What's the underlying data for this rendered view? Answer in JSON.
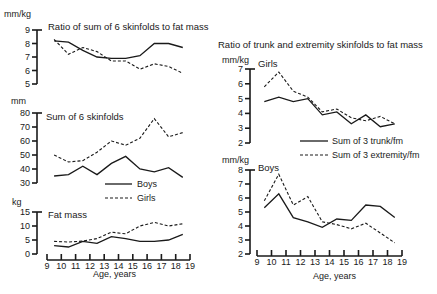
{
  "chart_data": [
    {
      "type": "line",
      "title": "Ratio of sum of 6 skinfolds to fat mass",
      "ylabel": "mm/kg",
      "xlabel": "Age, years",
      "ylim": [
        5,
        9
      ],
      "yticks": [
        5,
        6,
        7,
        8,
        9
      ],
      "x": [
        9.5,
        10.5,
        11.5,
        12.5,
        13.5,
        14.5,
        15.5,
        16.5,
        17.5,
        18.5
      ],
      "series": [
        {
          "name": "Boys",
          "style": "solid",
          "values": [
            8.2,
            8.1,
            7.5,
            7.0,
            6.9,
            6.9,
            7.1,
            8.0,
            8.0,
            7.7
          ]
        },
        {
          "name": "Girls",
          "style": "dashed",
          "values": [
            8.3,
            7.2,
            7.7,
            7.4,
            6.7,
            6.7,
            6.1,
            6.5,
            6.3,
            5.8
          ]
        }
      ]
    },
    {
      "type": "line",
      "title": "Sum of 6 skinfolds",
      "ylabel": "mm",
      "xlabel": "Age, years",
      "ylim": [
        30,
        80
      ],
      "yticks": [
        30,
        40,
        50,
        60,
        70,
        80
      ],
      "x": [
        9.5,
        10.5,
        11.5,
        12.5,
        13.5,
        14.5,
        15.5,
        16.5,
        17.5,
        18.5
      ],
      "series": [
        {
          "name": "Boys",
          "style": "solid",
          "values": [
            35,
            36,
            42,
            36,
            44,
            49,
            40,
            38,
            41,
            34
          ]
        },
        {
          "name": "Girls",
          "style": "dashed",
          "values": [
            50,
            45,
            46,
            52,
            60,
            57,
            62,
            76,
            63,
            66
          ]
        }
      ]
    },
    {
      "type": "line",
      "title": "Fat mass",
      "ylabel": "kg",
      "xlabel": "Age, years",
      "ylim": [
        0,
        15
      ],
      "yticks": [
        0,
        5,
        10,
        15
      ],
      "x": [
        9.5,
        10.5,
        11.5,
        12.5,
        13.5,
        14.5,
        15.5,
        16.5,
        17.5,
        18.5
      ],
      "series": [
        {
          "name": "Boys",
          "style": "solid",
          "values": [
            3.0,
            2.5,
            4.5,
            3.8,
            6.2,
            5.5,
            4.5,
            4.5,
            5.0,
            7.0
          ]
        },
        {
          "name": "Girls",
          "style": "dashed",
          "values": [
            4.5,
            4.3,
            4.6,
            5.5,
            7.8,
            7.2,
            10.0,
            11.3,
            10.0,
            10.8
          ]
        }
      ]
    },
    {
      "type": "line",
      "title": "Ratio of trunk and extremity skinfolds to fat mass — Girls",
      "ylabel": "mm/kg",
      "xlabel": "Age, years",
      "ylim": [
        2,
        7
      ],
      "yticks": [
        2,
        3,
        4,
        5,
        6,
        7
      ],
      "x": [
        9.5,
        10.5,
        11.5,
        12.5,
        13.5,
        14.5,
        15.5,
        16.5,
        17.5,
        18.5
      ],
      "series": [
        {
          "name": "Sum of 3 trunk/fm",
          "style": "solid",
          "values": [
            4.8,
            5.1,
            4.8,
            5.0,
            3.9,
            4.1,
            3.3,
            3.9,
            3.1,
            3.3
          ]
        },
        {
          "name": "Sum of 3 extremity/fm",
          "style": "dashed",
          "values": [
            5.8,
            6.8,
            5.5,
            5.1,
            4.1,
            4.3,
            3.7,
            3.5,
            3.8,
            3.3
          ]
        }
      ]
    },
    {
      "type": "line",
      "title": "Ratio of trunk and extremity skinfolds to fat mass — Boys",
      "ylabel": "mm/kg",
      "xlabel": "Age, years",
      "ylim": [
        2,
        8
      ],
      "yticks": [
        2,
        3,
        4,
        5,
        6,
        7,
        8
      ],
      "x": [
        9.5,
        10.5,
        11.5,
        12.5,
        13.5,
        14.5,
        15.5,
        16.5,
        17.5,
        18.5
      ],
      "series": [
        {
          "name": "Sum of 3 trunk/fm",
          "style": "solid",
          "values": [
            5.3,
            6.3,
            4.6,
            4.3,
            3.9,
            4.5,
            4.4,
            5.5,
            5.4,
            4.6
          ]
        },
        {
          "name": "Sum of 3 extremity/fm",
          "style": "dashed",
          "values": [
            5.8,
            7.7,
            5.5,
            6.1,
            4.3,
            4.1,
            3.8,
            4.2,
            3.5,
            2.8
          ]
        }
      ]
    }
  ],
  "labels": {
    "ratio_title": "Ratio of sum of 6 skinfolds to fat mass",
    "ratio_unit": "mm/kg",
    "sum_title": "Sum of 6 skinfolds",
    "sum_unit": "mm",
    "fat_title": "Fat mass",
    "fat_unit": "kg",
    "right_title": "Ratio of trunk and extremity skinfolds to fat mass",
    "girls_unit": "mm/kg",
    "girls_label": "Girls",
    "boys_unit": "mm/kg",
    "boys_label": "Boys",
    "xlabel": "Age, years",
    "legend_left": [
      "Boys",
      "Girls"
    ],
    "legend_right": [
      "Sum of 3 trunk/fm",
      "Sum of 3 extremity/fm"
    ],
    "xticks": [
      "9",
      "10",
      "11",
      "12",
      "13",
      "14",
      "15",
      "16",
      "17",
      "18",
      "19"
    ]
  }
}
